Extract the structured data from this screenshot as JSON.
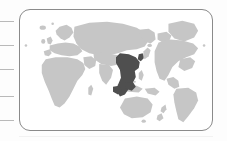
{
  "card": {
    "title": "World map region selector",
    "border_color": "#8a8a8a",
    "background_color": "#ffffff",
    "corner_radius_px": 11,
    "x": 19,
    "y": 9,
    "width": 194,
    "height": 122
  },
  "axis": {
    "tick_color": "#b9b9b9",
    "tick_count": 5,
    "tick_length_px": 14,
    "tick_positions_y": [
      21,
      45,
      69,
      96,
      120
    ],
    "side": "left"
  },
  "map": {
    "projection_note": "Asia-Pacific centred world map",
    "ocean_color": "#ffffff",
    "land_color": "#c6c6c6",
    "highlight_color": "#4f4f4f",
    "highlighted_region_label": "East and Southeast Asia",
    "regions": [
      {
        "name": "europe",
        "label": "Europe",
        "highlighted": false
      },
      {
        "name": "africa",
        "label": "Africa",
        "highlighted": false
      },
      {
        "name": "asia",
        "label": "Asia",
        "highlighted": false
      },
      {
        "name": "east-southeast-asia",
        "label": "East & Southeast Asia",
        "highlighted": true
      },
      {
        "name": "australia",
        "label": "Australia",
        "highlighted": false
      },
      {
        "name": "new-zealand",
        "label": "New Zealand",
        "highlighted": false
      },
      {
        "name": "north-america",
        "label": "North America",
        "highlighted": false
      },
      {
        "name": "south-america",
        "label": "South America",
        "highlighted": false
      },
      {
        "name": "greenland",
        "label": "Greenland",
        "highlighted": false
      },
      {
        "name": "british-isles",
        "label": "British Isles",
        "highlighted": false
      },
      {
        "name": "iceland",
        "label": "Iceland",
        "highlighted": false
      },
      {
        "name": "japan",
        "label": "Japan",
        "highlighted": false
      },
      {
        "name": "madagascar",
        "label": "Madagascar",
        "highlighted": false
      }
    ]
  },
  "chart_data": {
    "type": "map",
    "categories": [
      "Europe",
      "Africa",
      "Asia",
      "East & Southeast Asia",
      "Australia",
      "North America",
      "South America",
      "Greenland"
    ],
    "values": [
      0,
      0,
      0,
      1,
      0,
      0,
      0,
      0
    ],
    "legend": [
      "land",
      "highlighted region"
    ],
    "colors": [
      "#c6c6c6",
      "#4f4f4f"
    ]
  }
}
